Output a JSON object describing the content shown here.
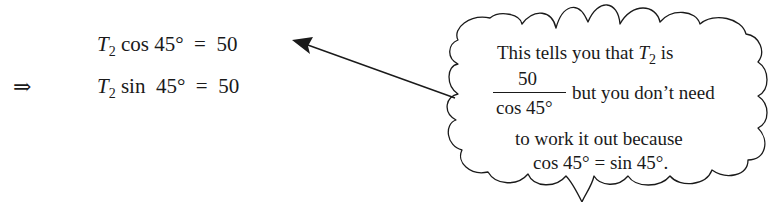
{
  "equations": {
    "implies_symbol": "⇒",
    "eq1": {
      "variable": "T",
      "subscript": "2",
      "function": "cos",
      "angle": "45°",
      "operator": "=",
      "value": "50"
    },
    "eq2": {
      "variable": "T",
      "subscript": "2",
      "function": "sin",
      "angle": "45°",
      "operator": "=",
      "value": "50"
    }
  },
  "callout": {
    "line1_prefix": "This tells you that ",
    "line1_variable": "T",
    "line1_subscript": "2",
    "line1_suffix": " is",
    "fraction_numerator": "50",
    "fraction_denominator": "cos 45°",
    "line2": "but you don’t need",
    "line3": "to work it out because",
    "line4": "cos 45° = sin 45°."
  },
  "colors": {
    "ink": "#1a1a1a",
    "background": "#ffffff"
  }
}
